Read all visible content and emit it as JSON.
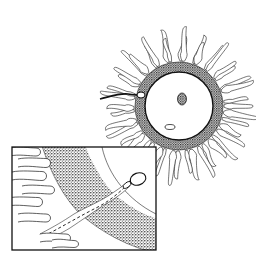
{
  "figure": {
    "colors": {
      "background": "#ffffff",
      "ink": "#1a1a1a",
      "zona_stipple": "#3a3a3a",
      "ooplasm": "#ffffff",
      "nucleus": "#555555"
    },
    "egg": {
      "center": [
        179,
        106
      ],
      "ooplasm_radius": 34,
      "zona_outer_radius": 44,
      "corona_outer_radius": 70,
      "corona_cell_count": 44,
      "nucleus": {
        "center": [
          182,
          99
        ],
        "rx": 4.5,
        "ry": 6
      },
      "polar_body": {
        "center": [
          170,
          127
        ],
        "rx": 5,
        "ry": 2.5
      },
      "penetrating_sperm": {
        "head": [
          140,
          95
        ],
        "tail_end": [
          100,
          99
        ]
      }
    },
    "inset": {
      "box": {
        "x": 12,
        "y": 147,
        "width": 144,
        "height": 103
      },
      "zona_band": "diagonal stippled band separating corona cells (left) from perivitelline space (right)",
      "oolemma_arc_radius": 95,
      "sperm_head": {
        "center": [
          138,
          179
        ],
        "rx": 8,
        "ry": 6
      },
      "penetration_track": "dashed channel through the zona band"
    }
  }
}
